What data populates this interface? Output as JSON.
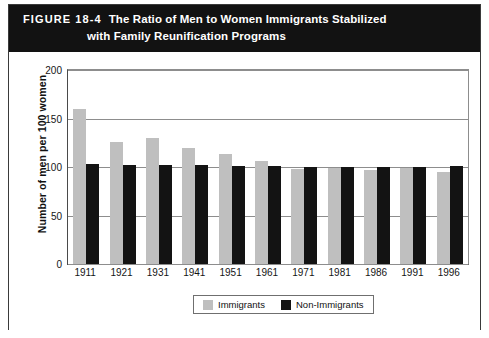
{
  "figure": {
    "label": "FIGURE 18-4",
    "title_line_1": "The Ratio of Men to Women Immigrants Stabilized",
    "title_line_2": "with Family Reunification Programs"
  },
  "legend": {
    "immigrants_label": "Immigrants",
    "nonimmigrants_label": "Non-Immigrants",
    "immigrants_color": "#bfbfbf",
    "nonimmigrants_color": "#131313"
  },
  "axes": {
    "ylabel": "Number of men per 100 women",
    "yticks": [
      200,
      150,
      100,
      50,
      0
    ]
  },
  "chart_data": {
    "type": "bar",
    "title": "The Ratio of Men to Women Immigrants Stabilized with Family Reunification Programs",
    "xlabel": "",
    "ylabel": "Number of men per 100 women",
    "ylim": [
      0,
      200
    ],
    "yticks": [
      0,
      50,
      100,
      150,
      200
    ],
    "grid": true,
    "legend_position": "bottom-center",
    "categories": [
      "1911",
      "1921",
      "1931",
      "1941",
      "1951",
      "1961",
      "1971",
      "1981",
      "1986",
      "1991",
      "1996"
    ],
    "series": [
      {
        "name": "Immigrants",
        "color": "#bfbfbf",
        "values": [
          160,
          126,
          130,
          120,
          113,
          106,
          98,
          99,
          97,
          99,
          95
        ]
      },
      {
        "name": "Non-Immigrants",
        "color": "#131313",
        "values": [
          103,
          102,
          102,
          102,
          101,
          101,
          100,
          100,
          100,
          100,
          101
        ]
      }
    ]
  }
}
